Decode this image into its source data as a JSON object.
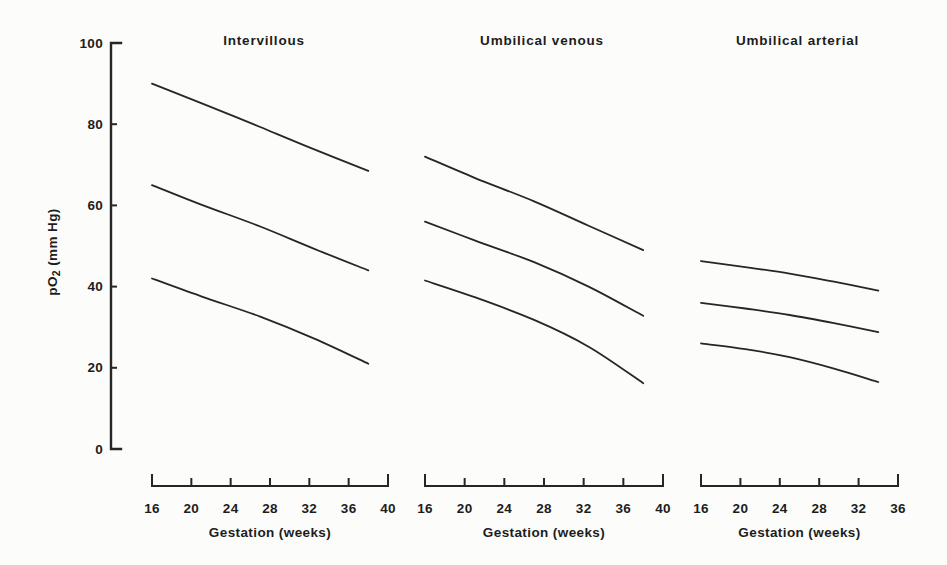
{
  "figure": {
    "background": "#fcfcfa",
    "ink": "#262626",
    "text_color": "#1d1d1d"
  },
  "y_axis": {
    "label": "pO2 (mm Hg)",
    "label_pre": "pO",
    "label_sub": "2",
    "label_post": " (mm Hg)",
    "ticks": [
      0,
      20,
      40,
      60,
      80,
      100
    ],
    "range": [
      0,
      100
    ]
  },
  "chart_data": [
    {
      "type": "line",
      "title": "Intervillous",
      "xlabel": "Gestation (weeks)",
      "ylabel": "pO2 (mm Hg)",
      "xlim": [
        16,
        40
      ],
      "ylim": [
        0,
        100
      ],
      "xticks": [
        16,
        20,
        24,
        28,
        32,
        36,
        40
      ],
      "yticks": [
        0,
        20,
        40,
        60,
        80,
        100
      ],
      "grid": false,
      "legend": "none",
      "series": [
        {
          "name": "upper limit",
          "points": [
            [
              16,
              90
            ],
            [
              21,
              85.2
            ],
            [
              27,
              79.3
            ],
            [
              32.5,
              73.8
            ],
            [
              38,
              68.5
            ]
          ]
        },
        {
          "name": "mean",
          "points": [
            [
              16,
              65
            ],
            [
              21,
              60.2
            ],
            [
              27,
              54.8
            ],
            [
              32.5,
              49.3
            ],
            [
              38,
              44
            ]
          ]
        },
        {
          "name": "lower limit",
          "points": [
            [
              16,
              42
            ],
            [
              21,
              37.6
            ],
            [
              27,
              32.6
            ],
            [
              32.5,
              27.2
            ],
            [
              38,
              21
            ]
          ]
        }
      ]
    },
    {
      "type": "line",
      "title": "Umbilical venous",
      "xlabel": "Gestation (weeks)",
      "ylabel": "pO2 (mm Hg)",
      "xlim": [
        16,
        40
      ],
      "ylim": [
        0,
        100
      ],
      "xticks": [
        16,
        20,
        24,
        28,
        32,
        36,
        40
      ],
      "yticks": [
        0,
        20,
        40,
        60,
        80,
        100
      ],
      "grid": false,
      "legend": "none",
      "series": [
        {
          "name": "upper limit",
          "points": [
            [
              16,
              72
            ],
            [
              21,
              66.8
            ],
            [
              27,
              61
            ],
            [
              32.5,
              55
            ],
            [
              38,
              49
            ]
          ]
        },
        {
          "name": "mean",
          "points": [
            [
              16,
              56
            ],
            [
              21,
              51.4
            ],
            [
              27,
              46
            ],
            [
              32.5,
              40
            ],
            [
              38,
              32.8
            ]
          ]
        },
        {
          "name": "lower limit",
          "points": [
            [
              16,
              41.5
            ],
            [
              21,
              37.4
            ],
            [
              27,
              31.8
            ],
            [
              32.5,
              25.2
            ],
            [
              38,
              16.2
            ]
          ]
        }
      ]
    },
    {
      "type": "line",
      "title": "Umbilical arterial",
      "xlabel": "Gestation (weeks)",
      "ylabel": "pO2 (mm Hg)",
      "xlim": [
        16,
        36
      ],
      "ylim": [
        0,
        100
      ],
      "xticks": [
        16,
        20,
        24,
        28,
        32,
        36
      ],
      "yticks": [
        0,
        20,
        40,
        60,
        80,
        100
      ],
      "grid": false,
      "legend": "none",
      "series": [
        {
          "name": "upper limit",
          "points": [
            [
              16,
              46.3
            ],
            [
              20.5,
              44.8
            ],
            [
              25,
              43.2
            ],
            [
              29.5,
              41.2
            ],
            [
              34,
              39
            ]
          ]
        },
        {
          "name": "mean",
          "points": [
            [
              16,
              36
            ],
            [
              20.5,
              34.6
            ],
            [
              25,
              33
            ],
            [
              29.5,
              31
            ],
            [
              34,
              28.8
            ]
          ]
        },
        {
          "name": "lower limit",
          "points": [
            [
              16,
              26
            ],
            [
              20.5,
              24.6
            ],
            [
              25,
              22.6
            ],
            [
              29.5,
              19.8
            ],
            [
              34,
              16.5
            ]
          ]
        }
      ]
    }
  ]
}
